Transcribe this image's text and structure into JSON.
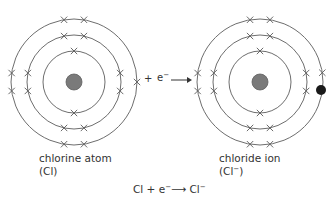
{
  "atoms": [
    {
      "id": "chlorine-atom",
      "label": "chlorine atom",
      "symbol": "(Cl)",
      "center": [
        74,
        82
      ],
      "nucleus_radius": 8,
      "shell_radii": [
        31,
        47,
        63
      ],
      "shell_electrons": [
        2,
        8,
        7
      ],
      "extra_electron": false
    },
    {
      "id": "chloride-ion",
      "label": "chloride ion",
      "symbol_base": "(Cl",
      "symbol_sup": "−",
      "symbol_end": ")",
      "center": [
        260,
        82
      ],
      "nucleus_radius": 8,
      "shell_radii": [
        31,
        47,
        63
      ],
      "shell_electrons": [
        2,
        8,
        8
      ],
      "extra_electron": true
    }
  ],
  "middle_reaction": {
    "plus": "+",
    "electron": "e",
    "electron_charge": "−",
    "arrow": "⟶"
  },
  "equation": {
    "reactant": "Cl",
    "plus": "+",
    "electron": "e",
    "electron_charge": "−",
    "arrow": "⟶",
    "product": "Cl",
    "product_charge": "−"
  },
  "colors": {
    "ring": "#6e6e6e",
    "nucleus": "#7a7a7a",
    "gained_electron": "#1a1a1a",
    "cross": "#5a5a5a"
  }
}
